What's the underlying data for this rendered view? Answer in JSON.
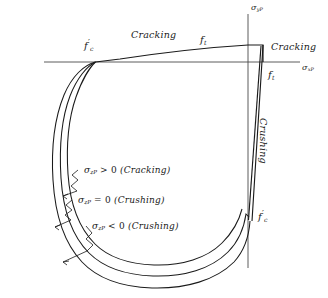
{
  "figure": {
    "background_color": "#ffffff",
    "line_color": "#1a1a1a",
    "axes": {
      "x_label": "σ",
      "x_label_sub": "xP",
      "y_label": "σ",
      "y_label_sub": "yP"
    },
    "region_labels": [
      {
        "text": "Cracking",
        "position": "top-center"
      },
      {
        "text": "Cracking",
        "position": "top-right"
      },
      {
        "text": "Crushing",
        "position": "right-vertical"
      }
    ],
    "material_labels": [
      {
        "text": "f",
        "prime": "′",
        "sub": "c",
        "position": "left-axis-crossing"
      },
      {
        "text": "f",
        "prime": "",
        "sub": "t",
        "position": "top-peak"
      },
      {
        "text": "f",
        "prime": "",
        "sub": "t",
        "position": "right-axis"
      },
      {
        "text": "f",
        "prime": "′",
        "sub": "c",
        "position": "bottom-axis"
      }
    ],
    "annotations": [
      {
        "symbol": "σ",
        "sub": "zP",
        "operator": ">",
        "value": "0",
        "mode": "(Cracking)"
      },
      {
        "symbol": "σ",
        "sub": "zP",
        "operator": "=",
        "value": "0",
        "mode": "(Crushing)"
      },
      {
        "symbol": "σ",
        "sub": "zP",
        "operator": "<",
        "value": "0",
        "mode": "(Crushing)"
      }
    ],
    "curves": {
      "count": 3,
      "description": "Three nested failure envelope curves"
    }
  }
}
